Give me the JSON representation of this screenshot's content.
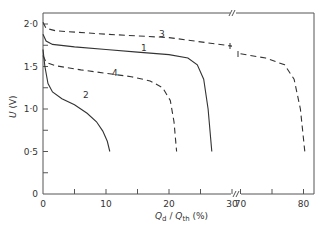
{
  "chart_data": {
    "type": "line",
    "title": "",
    "xlabel": "Qd / Qth (%)",
    "xlabel_parts": {
      "q": "Q",
      "sub_d": "d",
      "slash": " / ",
      "q2": "Q",
      "sub_th": "th",
      "unit": " (%)"
    },
    "ylabel": "U (V)",
    "ylabel_parts": {
      "u": "U",
      "unit": " (V)"
    },
    "xlim_left": [
      0,
      30
    ],
    "xlim_right": [
      70,
      82
    ],
    "x_axis_break": "between 30 and 70",
    "ylim": [
      0,
      2.13
    ],
    "x_ticks": [
      "0",
      "10",
      "20",
      "30",
      "70",
      "80"
    ],
    "y_ticks": [
      "0",
      "0·5",
      "1·0",
      "1·5",
      "2·0"
    ],
    "grid": false,
    "legend": "inline curve labels 1-4",
    "series": [
      {
        "name": "1",
        "style": "solid",
        "points": [
          [
            0,
            1.88
          ],
          [
            0.5,
            1.8
          ],
          [
            1.5,
            1.76
          ],
          [
            5,
            1.73
          ],
          [
            10,
            1.7
          ],
          [
            15,
            1.67
          ],
          [
            20,
            1.64
          ],
          [
            23,
            1.6
          ],
          [
            24.5,
            1.52
          ],
          [
            25.5,
            1.35
          ],
          [
            26.2,
            1.0
          ],
          [
            26.8,
            0.5
          ]
        ]
      },
      {
        "name": "2",
        "style": "solid",
        "points": [
          [
            0,
            1.7
          ],
          [
            0.3,
            1.5
          ],
          [
            0.8,
            1.3
          ],
          [
            1.5,
            1.2
          ],
          [
            3,
            1.12
          ],
          [
            5,
            1.05
          ],
          [
            7,
            0.95
          ],
          [
            8.5,
            0.85
          ],
          [
            9.5,
            0.74
          ],
          [
            10.2,
            0.62
          ],
          [
            10.6,
            0.5
          ]
        ]
      },
      {
        "name": "3",
        "style": "dashed",
        "points": [
          [
            0,
            2.02
          ],
          [
            0.5,
            1.95
          ],
          [
            2,
            1.92
          ],
          [
            10,
            1.88
          ],
          [
            20,
            1.84
          ],
          [
            30,
            1.74
          ],
          [
            70,
            1.65
          ],
          [
            74,
            1.6
          ],
          [
            77,
            1.52
          ],
          [
            78.5,
            1.35
          ],
          [
            79.5,
            1.0
          ],
          [
            80.2,
            0.5
          ]
        ]
      },
      {
        "name": "4",
        "style": "dashed",
        "points": [
          [
            0,
            1.63
          ],
          [
            0.5,
            1.55
          ],
          [
            2,
            1.51
          ],
          [
            6,
            1.46
          ],
          [
            10,
            1.42
          ],
          [
            14,
            1.38
          ],
          [
            17,
            1.33
          ],
          [
            19,
            1.25
          ],
          [
            20.2,
            1.1
          ],
          [
            20.8,
            0.85
          ],
          [
            21.2,
            0.5
          ]
        ]
      }
    ]
  },
  "labels": {
    "c1": "1",
    "c2": "2",
    "c3": "3",
    "c4": "4"
  }
}
